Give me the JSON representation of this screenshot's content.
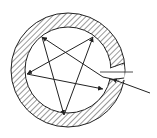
{
  "diagram": {
    "type": "ring-cross-section-with-ray-path",
    "colors": {
      "stroke": "#222222",
      "hatch": "#333333",
      "background": "#ffffff"
    },
    "ring": {
      "cx": 68,
      "cy": 70,
      "outer_r": 57,
      "inner_r": 43
    },
    "entry_gap": {
      "angle_deg": 10,
      "width_deg": 9
    },
    "ray_path": [
      {
        "from": [
          103,
          77
        ],
        "to": [
          42,
          37
        ]
      },
      {
        "from": [
          42,
          37
        ],
        "to": [
          64,
          115
        ]
      },
      {
        "from": [
          64,
          115
        ],
        "to": [
          93,
          37
        ]
      },
      {
        "from": [
          93,
          37
        ],
        "to": [
          27,
          74
        ]
      },
      {
        "from": [
          27,
          74
        ],
        "to": [
          103,
          89
        ]
      }
    ],
    "incident_ray": {
      "from": [
        150,
        93
      ],
      "to": [
        103,
        77
      ]
    },
    "normal_line": {
      "from": [
        100,
        73
      ],
      "to": [
        133,
        73
      ]
    }
  }
}
